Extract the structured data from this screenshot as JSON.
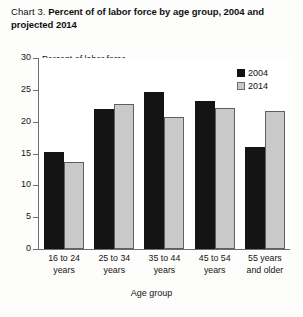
{
  "title": {
    "prefix": "Chart 3.",
    "main_line1": "Percent of of labor force by age group, 2004",
    "main_line2": "and projected 2014"
  },
  "unit_caption": "Percent of labor force",
  "axis_title_x": "Age group",
  "legend": {
    "items": [
      {
        "label": "2004",
        "color": "#141414"
      },
      {
        "label": "2014",
        "color": "#c9c9c9"
      }
    ]
  },
  "y_axis": {
    "ticks": [
      "30",
      "25",
      "20",
      "15",
      "10",
      "5",
      "0"
    ]
  },
  "chart_data": {
    "type": "bar",
    "title": "Chart 3. Percent of of labor force by age group, 2004 and projected 2014",
    "xlabel": "Age group",
    "ylabel": "Percent of labor force",
    "ylim": [
      0,
      30
    ],
    "ytick_step": 5,
    "grid": false,
    "legend_position": "top-right",
    "categories": [
      "16 to 24 years",
      "25 to 34 years",
      "35 to 44 years",
      "45 to 54 years",
      "55 years and older"
    ],
    "category_lines": [
      [
        "16 to 24",
        "years"
      ],
      [
        "25 to 34",
        "years"
      ],
      [
        "35 to 44",
        "years"
      ],
      [
        "45 to 54",
        "years"
      ],
      [
        "55 years",
        "and older"
      ]
    ],
    "series": [
      {
        "name": "2004",
        "color": "#141414",
        "values": [
          15.3,
          22.0,
          24.7,
          23.3,
          16.1
        ]
      },
      {
        "name": "2014",
        "color": "#c9c9c9",
        "values": [
          13.7,
          22.8,
          20.8,
          22.2,
          21.7
        ]
      }
    ]
  }
}
